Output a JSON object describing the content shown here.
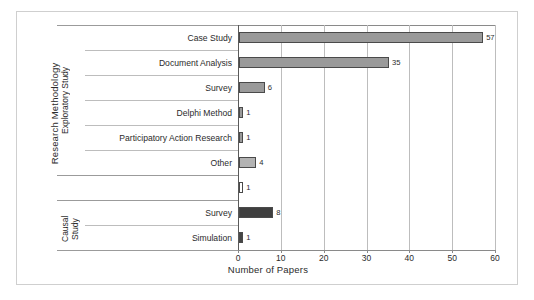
{
  "chart_data": {
    "type": "bar",
    "orientation": "horizontal",
    "title": "",
    "xlabel": "Number of Papers",
    "ylabel": "Research Methodology",
    "xlim": [
      0,
      60
    ],
    "xticks": [
      0,
      10,
      20,
      30,
      40,
      50,
      60
    ],
    "grid": true,
    "legend": "none",
    "groups": [
      {
        "name": "Exploratory Study",
        "row_start": 0,
        "row_end": 5
      },
      {
        "name": "Causal Study",
        "row_start": 7,
        "row_end": 8
      }
    ],
    "categories": [
      "Case Study",
      "Document Analysis",
      "Survey",
      "Delphi Method",
      "Participatory Action Research",
      "Other",
      "",
      "Survey",
      "Simulation"
    ],
    "values": [
      57,
      35,
      6,
      1,
      1,
      4,
      1,
      8,
      1
    ],
    "value_labels": [
      "57",
      "35",
      "6",
      "1",
      "1",
      "4",
      "1",
      "8",
      "1"
    ],
    "bar_fills": [
      "#9a9a9a",
      "#9a9a9a",
      "#9a9a9a",
      "#9a9a9a",
      "#9a9a9a",
      "#b3b3b3",
      "#ffffff",
      "#3f3f3f",
      "#454545"
    ],
    "bar_edge": "#4a4a4a",
    "grid_color": "#bdbdbd",
    "axis_color": "#8a8a8a",
    "frame_color": "#cfcfcf"
  },
  "group_labels": {
    "exploratory": "Exploratory Study",
    "causal": "Causal\nStudy"
  },
  "axis": {
    "y_title": "Research Methodology",
    "x_title": "Number of Papers",
    "tick_0": "0",
    "tick_10": "10",
    "tick_20": "20",
    "tick_30": "30",
    "tick_40": "40",
    "tick_50": "50",
    "tick_60": "60"
  }
}
